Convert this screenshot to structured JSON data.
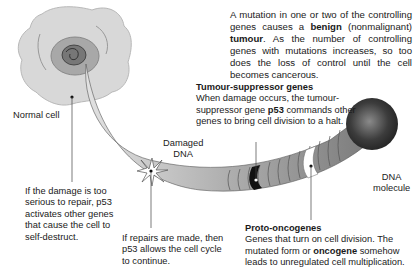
{
  "intro": {
    "pre": "A mutation in one or two of the controlling genes causes a ",
    "bold1": "benign",
    "mid": " (nonmalignant) ",
    "bold2": "tumour",
    "post": ". As the number of controlling genes with mutations increases, so too does the loss of control until the cell becomes cancerous."
  },
  "labels": {
    "normal_cell": "Normal cell",
    "damaged_dna_line1": "Damaged",
    "damaged_dna_line2": "DNA",
    "dna_molecule_line1": "DNA",
    "dna_molecule_line2": "molecule"
  },
  "tumour_suppressor": {
    "title": "Tumour-suppressor genes",
    "pre": "When damage occurs, the tumour-suppressor gene ",
    "bold": "p53",
    "post": " commands other genes to bring cell division to a halt."
  },
  "self_destruct": {
    "text": "If the damage is too serious to repair, p53 activates other genes that cause the cell to self-destruct."
  },
  "repairs": {
    "text": "If repairs are made, then p53 allows the cell cycle to continue."
  },
  "proto_oncogenes": {
    "title": "Proto-oncogenes",
    "pre": "Genes that turn on cell division. The mutated form or ",
    "bold": "oncogene",
    "post": " somehow leads to unregulated cell multiplication."
  },
  "colors": {
    "cell_fill": "#d8d8d8",
    "nucleus": "#9a9a9a",
    "tube_light": "#d4d4d4",
    "tube_dark": "#6a6a6a",
    "band_black": "#111111",
    "sphere": "#3c3c3c"
  }
}
